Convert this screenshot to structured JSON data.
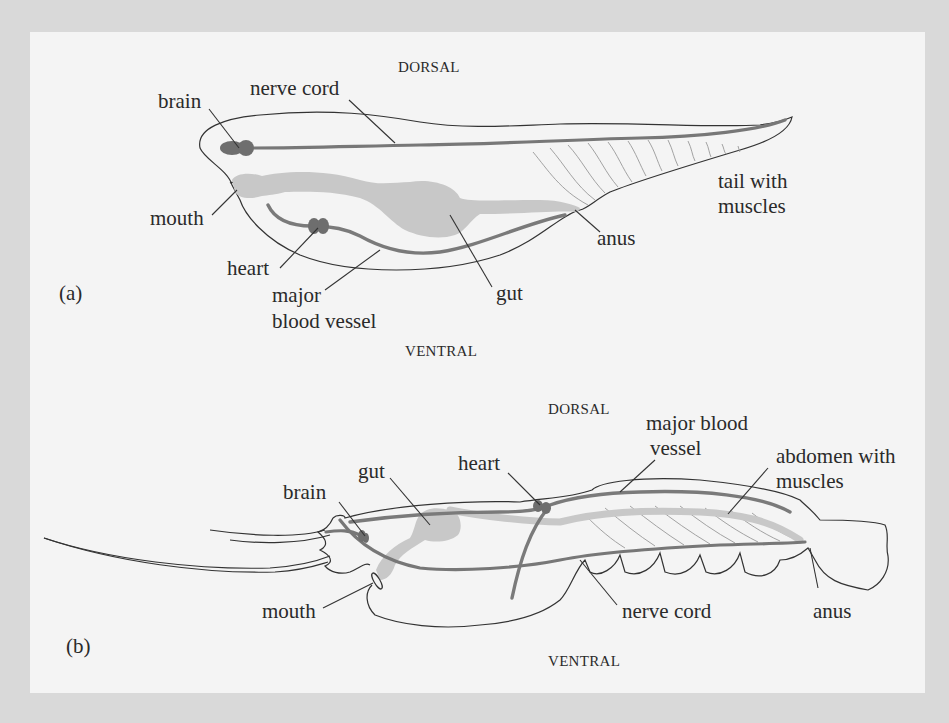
{
  "figure_a": {
    "panel_label": "(a)",
    "dorsal_label": "DORSAL",
    "ventral_label": "VENTRAL",
    "labels": {
      "brain": "brain",
      "nerve_cord": "nerve cord",
      "mouth": "mouth",
      "heart": "heart",
      "major_blood_vessel_1": "major",
      "major_blood_vessel_2": "blood vessel",
      "gut": "gut",
      "anus": "anus",
      "tail_1": "tail with",
      "tail_2": "muscles"
    }
  },
  "figure_b": {
    "panel_label": "(b)",
    "dorsal_label": "DORSAL",
    "ventral_label": "VENTRAL",
    "labels": {
      "brain": "brain",
      "gut": "gut",
      "heart": "heart",
      "major_blood_vessel_1": "major blood",
      "major_blood_vessel_2": "vessel",
      "abdomen_1": "abdomen with",
      "abdomen_2": "muscles",
      "mouth": "mouth",
      "nerve_cord": "nerve cord",
      "anus": "anus"
    }
  },
  "colors": {
    "background": "#d9d9d9",
    "panel": "#f4f4f4",
    "organ": "#6e6e6e",
    "gut": "#c8c8c8",
    "outline": "#333333"
  }
}
